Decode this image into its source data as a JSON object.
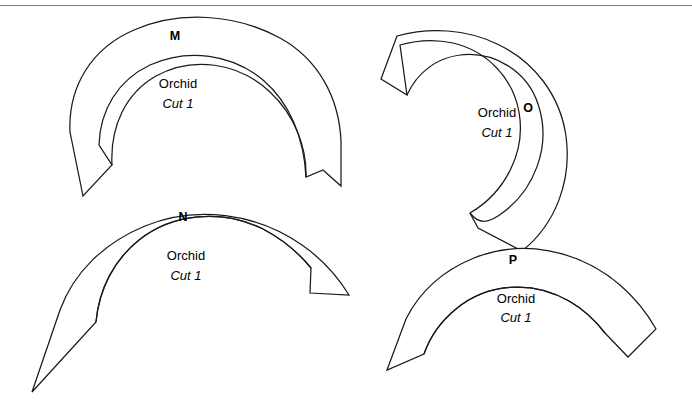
{
  "page": {
    "width": 692,
    "height": 401,
    "background_color": "#ffffff",
    "line_color": "#1a1a1a",
    "top_rule_color": "#7a7a7a"
  },
  "pieces": [
    {
      "id": "piece-m",
      "letter": "M",
      "fabric": "Orchid",
      "cut": "Cut 1",
      "letter_pos": {
        "x": 175,
        "y": 40
      },
      "name_pos": {
        "x": 178,
        "y": 88
      },
      "cut_pos": {
        "x": 178,
        "y": 108
      },
      "outline": "M 83,196 L 70,132 C 68,86 92,48 134,30 C 180,10 236,14 280,38 C 318,59 339,97 341,141 L 341,186 L 323,170 L 306,177 C 304,138 290,103 263,80 C 232,54 188,48 150,65 C 118,80 100,110 99,145 L 112,165 Z",
      "inner_line": "M 112,165 C 110,126 126,93 156,76 C 192,56 238,62 270,92 C 296,116 307,150 306,177"
    },
    {
      "id": "piece-n",
      "letter": "N",
      "fabric": "Orchid",
      "cut": "Cut 1",
      "letter_pos": {
        "x": 183,
        "y": 221
      },
      "name_pos": {
        "x": 186,
        "y": 260
      },
      "cut_pos": {
        "x": 186,
        "y": 280
      },
      "outline": "M 32,392 L 60,310 C 74,272 104,243 145,226 C 196,205 256,213 302,245 C 322,259 338,277 349,295 L 310,293 L 311,268 C 298,252 282,239 263,229 C 222,209 173,213 139,240 C 114,260 99,289 96,322 Z",
      "inner_line": "M 96,322 C 99,289 114,260 139,240 C 173,213 222,209 263,229 C 282,239 298,252 311,268"
    },
    {
      "id": "piece-o",
      "letter": "O",
      "fabric": "Orchid",
      "cut": "Cut 1",
      "letter_pos": {
        "x": 528,
        "y": 112
      },
      "name_pos": {
        "x": 497,
        "y": 117
      },
      "cut_pos": {
        "x": 497,
        "y": 137
      },
      "outline": "M 381,79 L 397,36 C 430,27 466,29 497,44 C 534,61 560,95 566,136 C 572,180 556,224 522,251 L 478,228 L 470,213 C 506,192 526,151 519,112 C 513,78 487,51 453,43 C 435,39 417,40 400,45 L 407,95 Z",
      "inner_line": "M 407,95 C 417,73 436,58 460,55 C 494,51 527,71 538,104 C 552,145 535,192 498,216 C 490,221 480,226 470,213"
    },
    {
      "id": "piece-p",
      "letter": "P",
      "fabric": "Orchid",
      "cut": "Cut 1",
      "letter_pos": {
        "x": 513,
        "y": 264
      },
      "name_pos": {
        "x": 516,
        "y": 303
      },
      "cut_pos": {
        "x": 516,
        "y": 322
      },
      "outline": "M 387,370 L 406,319 C 419,293 442,271 474,258 C 521,239 578,249 620,285 C 635,298 647,313 656,329 L 628,357 L 605,333 C 595,320 583,309 569,301 C 532,280 487,283 456,309 C 440,322 430,337 424,354 Z",
      "inner_line": "M 424,354 C 430,337 440,322 456,309 C 487,283 532,280 569,301 C 583,309 595,320 605,333"
    }
  ]
}
